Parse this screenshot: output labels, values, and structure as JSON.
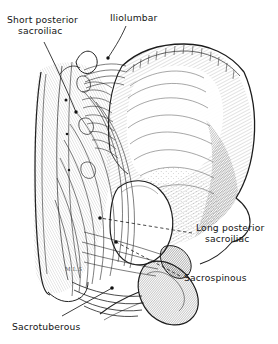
{
  "figure": {
    "background_color": "#ffffff",
    "ink_color": "#1a1a1a",
    "artist_signature": "M.L.S",
    "labels": [
      {
        "id": "short-posterior-sacroiliac",
        "line1": "Short posterior",
        "line2": "sacroiliac",
        "leader_style": "solid"
      },
      {
        "id": "iliolumbar",
        "line1": "Iliolumbar",
        "line2": "",
        "leader_style": "solid"
      },
      {
        "id": "long-posterior-sacroiliac",
        "line1": "Long posterior",
        "line2": "sacroiliac",
        "leader_style": "dashed"
      },
      {
        "id": "sacrospinous",
        "line1": "Sacrospinous",
        "line2": "",
        "leader_style": "dashed"
      },
      {
        "id": "sacrotuberous",
        "line1": "Sacrotuberous",
        "line2": "",
        "leader_style": "solid"
      }
    ]
  }
}
